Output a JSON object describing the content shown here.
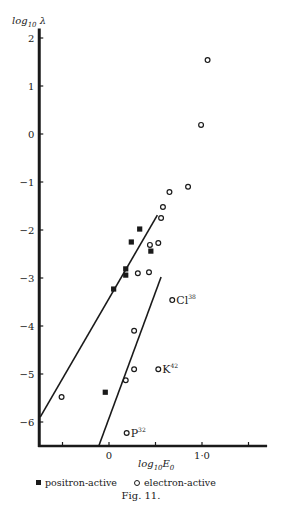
{
  "figure": {
    "caption": "Fig. 11."
  },
  "legend": {
    "positron_label": "positron-active",
    "electron_label": "electron-active"
  },
  "colors": {
    "ink": "#1a1a1a",
    "background": "#ffffff"
  },
  "chart_data": {
    "type": "scatter",
    "title": "",
    "xlabel": "log10 E0",
    "ylabel": "log10 λ",
    "xlim": [
      -0.75,
      1.7
    ],
    "ylim": [
      -6.5,
      2.2
    ],
    "x_ticks": [
      -0.5,
      0,
      0.5,
      1.0,
      1.5
    ],
    "x_tick_labels": [
      {
        "value": 0,
        "label": "0"
      },
      {
        "value": 1.0,
        "label": "1·0"
      }
    ],
    "y_ticks": [
      2,
      1,
      0,
      -1,
      -2,
      -3,
      -4,
      -5,
      -6
    ],
    "y_tick_labels": [
      "2",
      "1",
      "0",
      "−1",
      "−2",
      "−3",
      "−4",
      "−5",
      "−6"
    ],
    "grid": false,
    "legend_position": "bottom",
    "series": [
      {
        "name": "positron-active",
        "marker": "filled-square",
        "points": [
          {
            "x": 0.33,
            "y": -1.98
          },
          {
            "x": 0.24,
            "y": -2.25
          },
          {
            "x": 0.45,
            "y": -2.44
          },
          {
            "x": 0.18,
            "y": -2.81
          },
          {
            "x": 0.18,
            "y": -2.94
          },
          {
            "x": 0.05,
            "y": -3.23
          },
          {
            "x": -0.04,
            "y": -5.38
          }
        ]
      },
      {
        "name": "electron-active",
        "marker": "open-circle",
        "points": [
          {
            "x": 1.06,
            "y": 1.54
          },
          {
            "x": 0.99,
            "y": 0.19
          },
          {
            "x": 0.85,
            "y": -1.1
          },
          {
            "x": 0.65,
            "y": -1.21
          },
          {
            "x": 0.58,
            "y": -1.52
          },
          {
            "x": 0.56,
            "y": -1.75
          },
          {
            "x": 0.44,
            "y": -2.31
          },
          {
            "x": 0.53,
            "y": -2.27
          },
          {
            "x": 0.31,
            "y": -2.9
          },
          {
            "x": 0.43,
            "y": -2.88
          },
          {
            "x": 0.68,
            "y": -3.46,
            "label": "Cl",
            "sup": "38"
          },
          {
            "x": 0.27,
            "y": -4.1
          },
          {
            "x": 0.27,
            "y": -4.9
          },
          {
            "x": 0.53,
            "y": -4.9,
            "label": "K",
            "sup": "42"
          },
          {
            "x": 0.18,
            "y": -5.13
          },
          {
            "x": -0.51,
            "y": -5.48
          },
          {
            "x": 0.19,
            "y": -6.23,
            "label": "P",
            "sup": "32"
          }
        ]
      }
    ],
    "lines": [
      {
        "name": "boundary-line-left",
        "from": {
          "x": -0.74,
          "y": -5.9
        },
        "to": {
          "x": 0.52,
          "y": -1.69
        }
      },
      {
        "name": "boundary-line-right",
        "from": {
          "x": -0.11,
          "y": -6.5
        },
        "to": {
          "x": 0.56,
          "y": -2.98
        }
      }
    ]
  }
}
